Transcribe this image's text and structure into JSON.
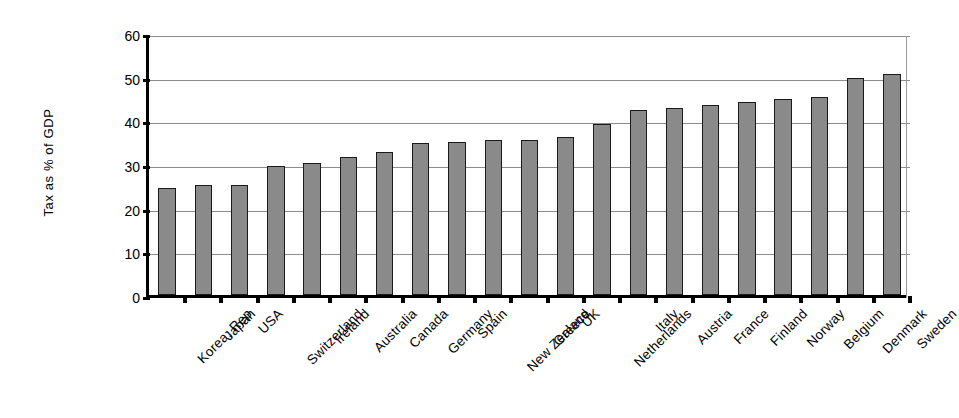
{
  "chart_data": {
    "type": "bar",
    "title": "",
    "subtitle": "",
    "xlabel": "",
    "ylabel": "Tax as % of GDP",
    "ylim": [
      0,
      60
    ],
    "yticks": [
      0,
      10,
      20,
      30,
      40,
      50,
      60
    ],
    "ytick_labels": [
      "0",
      "10",
      "20",
      "30",
      "40",
      "50",
      "60"
    ],
    "grid": true,
    "legend": null,
    "bar_color": "#8a8a8a",
    "bar_edge_color": "#1a1a1a",
    "axis_color": "#000000",
    "gridline_color": "#8d8d8d",
    "background": "#ffffff",
    "categories": [
      "Korea, Rep",
      "Japan",
      "USA",
      "Switzerland",
      "Ireland",
      "Australia",
      "Canada",
      "Germany",
      "Spain",
      "New Zealand",
      "Greece",
      "UK",
      "Netherlands",
      "Italy",
      "Austria",
      "France",
      "Finland",
      "Norway",
      "Belgium",
      "Denmark",
      "Sweden"
    ],
    "values": [
      24.5,
      25.1,
      25.2,
      29.5,
      30.2,
      31.6,
      32.7,
      34.7,
      35.1,
      35.4,
      35.6,
      36.2,
      39.2,
      42.3,
      42.8,
      43.5,
      44.1,
      44.8,
      45.3,
      49.8,
      50.5
    ]
  }
}
